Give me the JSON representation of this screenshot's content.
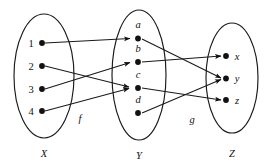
{
  "diagram": {
    "type": "mapping-diagram",
    "ink_color": "#1a1a1a",
    "background_color": "#ffffff",
    "sets": [
      {
        "id": "X",
        "label": "X",
        "elements": [
          {
            "id": "x1",
            "label": "1",
            "label_side": "left"
          },
          {
            "id": "x2",
            "label": "2",
            "label_side": "left"
          },
          {
            "id": "x3",
            "label": "3",
            "label_side": "left"
          },
          {
            "id": "x4",
            "label": "4",
            "label_side": "left"
          }
        ]
      },
      {
        "id": "Y",
        "label": "Y",
        "elements": [
          {
            "id": "ya",
            "label": "a",
            "label_side": "above"
          },
          {
            "id": "yb",
            "label": "b",
            "label_side": "above"
          },
          {
            "id": "yc",
            "label": "c",
            "label_side": "above"
          },
          {
            "id": "yd",
            "label": "d",
            "label_side": "above"
          }
        ]
      },
      {
        "id": "Z",
        "label": "Z",
        "elements": [
          {
            "id": "zx",
            "label": "x",
            "label_side": "right"
          },
          {
            "id": "zy",
            "label": "y",
            "label_side": "right"
          },
          {
            "id": "zz",
            "label": "z",
            "label_side": "right"
          }
        ]
      }
    ],
    "maps": [
      {
        "id": "f",
        "label": "f",
        "from": "X",
        "to": "Y",
        "edges": [
          {
            "from": "1",
            "to": "a"
          },
          {
            "from": "2",
            "to": "c"
          },
          {
            "from": "3",
            "to": "b"
          },
          {
            "from": "4",
            "to": "c"
          }
        ]
      },
      {
        "id": "g",
        "label": "g",
        "from": "Y",
        "to": "Z",
        "edges": [
          {
            "from": "a",
            "to": "y"
          },
          {
            "from": "b",
            "to": "x"
          },
          {
            "from": "c",
            "to": "z"
          },
          {
            "from": "d",
            "to": "y"
          }
        ]
      }
    ]
  }
}
